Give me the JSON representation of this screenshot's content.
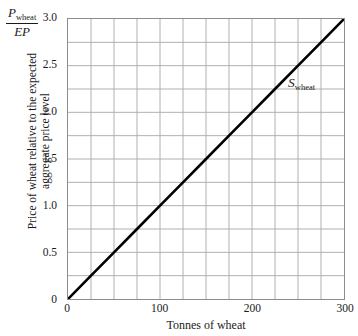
{
  "chart_data": {
    "type": "line",
    "title": "",
    "xlabel": "Tonnes of wheat",
    "ylabel_line1": "Price of wheat relative to the expected",
    "ylabel_line2": "aggregate price level",
    "ylabel_ratio_numerator_symbol": "P",
    "ylabel_ratio_numerator_subscript": "wheat",
    "ylabel_ratio_denominator": "EP",
    "xlim": [
      0,
      300
    ],
    "ylim": [
      0,
      3.0
    ],
    "x_ticks": [
      0,
      100,
      200,
      300
    ],
    "x_tick_labels": [
      "0",
      "100",
      "200",
      "300"
    ],
    "y_ticks": [
      0,
      0.5,
      1.0,
      1.5,
      2.0,
      2.5,
      3.0
    ],
    "y_tick_labels": [
      "0",
      "0.5",
      "1.0",
      "1.5",
      "2.0",
      "2.5",
      "3.0"
    ],
    "x_minor_step": 25,
    "y_minor_step": 0.25,
    "grid": true,
    "grid_color": "#b0b0b0",
    "axis_color": "#8c8c8c",
    "legend_position": "inline-curve-label",
    "series": [
      {
        "name": "S_wheat",
        "label_symbol": "S",
        "label_subscript": "wheat",
        "color": "#000000",
        "line_width": 2.6,
        "points": [
          {
            "x": 0,
            "y": 0.0
          },
          {
            "x": 25,
            "y": 0.25
          },
          {
            "x": 50,
            "y": 0.5
          },
          {
            "x": 75,
            "y": 0.75
          },
          {
            "x": 100,
            "y": 1.0
          },
          {
            "x": 125,
            "y": 1.25
          },
          {
            "x": 150,
            "y": 1.5
          },
          {
            "x": 175,
            "y": 1.75
          },
          {
            "x": 200,
            "y": 2.0
          },
          {
            "x": 225,
            "y": 2.25
          },
          {
            "x": 250,
            "y": 2.5
          },
          {
            "x": 275,
            "y": 2.75
          },
          {
            "x": 300,
            "y": 3.0
          }
        ]
      }
    ]
  }
}
